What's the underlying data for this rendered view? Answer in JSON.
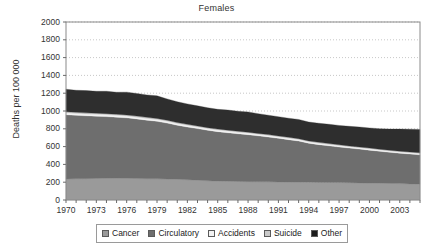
{
  "chart_data": {
    "type": "area",
    "stacked": true,
    "title": "Females",
    "xlabel": "",
    "ylabel": "Deaths per 100 000",
    "xlim": [
      1970,
      2005
    ],
    "ylim": [
      0,
      2000
    ],
    "grid": true,
    "grid_style": "dotted-horizontal",
    "legend_position": "bottom",
    "ytick_labels": [
      "2000",
      "1800",
      "1600",
      "1400",
      "1200",
      "1000",
      "800",
      "600",
      "400",
      "200",
      "0"
    ],
    "ytick_values": [
      2000,
      1800,
      1600,
      1400,
      1200,
      1000,
      800,
      600,
      400,
      200,
      0
    ],
    "xtick_labels": [
      "1970",
      "1973",
      "1976",
      "1979",
      "1982",
      "1985",
      "1988",
      "1991",
      "1994",
      "1997",
      "2000",
      "2003"
    ],
    "xtick_values": [
      1970,
      1973,
      1976,
      1979,
      1982,
      1985,
      1988,
      1991,
      1994,
      1997,
      2000,
      2003
    ],
    "x": [
      1970,
      1971,
      1972,
      1973,
      1974,
      1975,
      1976,
      1977,
      1978,
      1979,
      1980,
      1981,
      1982,
      1983,
      1984,
      1985,
      1986,
      1987,
      1988,
      1989,
      1990,
      1991,
      1992,
      1993,
      1994,
      1995,
      1996,
      1997,
      1998,
      1999,
      2000,
      2001,
      2002,
      2003,
      2004,
      2005
    ],
    "series": [
      {
        "name": "Cancer",
        "color": "#9a9a9a",
        "values": [
          236,
          239,
          240,
          242,
          243,
          244,
          243,
          241,
          239,
          238,
          236,
          232,
          228,
          222,
          216,
          212,
          210,
          208,
          206,
          205,
          204,
          203,
          202,
          201,
          200,
          198,
          197,
          196,
          194,
          192,
          190,
          188,
          186,
          184,
          181,
          178
        ]
      },
      {
        "name": "Circulatory",
        "color": "#6e6e6e",
        "values": [
          722,
          712,
          706,
          700,
          694,
          686,
          680,
          670,
          658,
          646,
          628,
          608,
          592,
          580,
          568,
          556,
          546,
          536,
          528,
          516,
          504,
          490,
          476,
          462,
          438,
          424,
          412,
          400,
          390,
          380,
          370,
          360,
          350,
          342,
          336,
          330
        ]
      },
      {
        "name": "Accidents",
        "color": "#f2f2f2",
        "values": [
          22,
          22,
          21,
          21,
          21,
          21,
          21,
          20,
          20,
          20,
          20,
          19,
          19,
          19,
          18,
          18,
          18,
          18,
          18,
          17,
          17,
          17,
          17,
          16,
          16,
          16,
          16,
          15,
          15,
          15,
          15,
          14,
          14,
          14,
          14,
          14
        ]
      },
      {
        "name": "Suicide",
        "color": "#c9c9c9",
        "values": [
          12,
          12,
          12,
          12,
          12,
          12,
          12,
          12,
          12,
          12,
          12,
          11,
          11,
          11,
          11,
          11,
          11,
          11,
          10,
          10,
          10,
          10,
          10,
          10,
          10,
          10,
          10,
          9,
          9,
          9,
          9,
          9,
          9,
          9,
          9,
          9
        ]
      },
      {
        "name": "Other",
        "color": "#2e2e2e",
        "values": [
          253,
          248,
          250,
          247,
          252,
          248,
          256,
          254,
          252,
          254,
          240,
          234,
          230,
          226,
          224,
          222,
          226,
          224,
          228,
          222,
          218,
          216,
          214,
          216,
          212,
          214,
          216,
          218,
          220,
          224,
          226,
          230,
          238,
          248,
          256,
          262
        ]
      }
    ],
    "totals": [
      1245,
      1233,
      1229,
      1222,
      1222,
      1211,
      1212,
      1197,
      1181,
      1170,
      1136,
      1104,
      1080,
      1058,
      1037,
      1019,
      1011,
      997,
      990,
      970,
      953,
      936,
      919,
      905,
      876,
      862,
      851,
      838,
      828,
      820,
      810,
      801,
      797,
      797,
      796,
      793
    ]
  },
  "legend": {
    "items": [
      {
        "label": "Cancer",
        "color": "#9a9a9a"
      },
      {
        "label": "Circulatory",
        "color": "#6e6e6e"
      },
      {
        "label": "Accidents",
        "color": "#f2f2f2"
      },
      {
        "label": "Suicide",
        "color": "#c9c9c9"
      },
      {
        "label": "Other",
        "color": "#1c1c1c"
      }
    ]
  },
  "axes": {
    "plot_left": 66,
    "plot_right": 420,
    "plot_top": 22,
    "plot_bottom": 200
  }
}
